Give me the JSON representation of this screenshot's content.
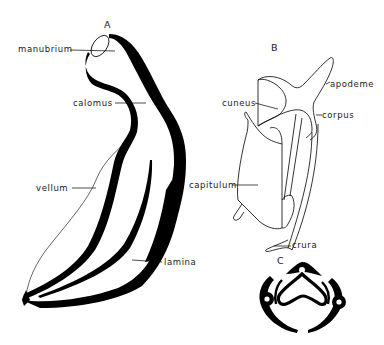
{
  "figure_A": {
    "letter": "A",
    "labels": {
      "manubrium": "manubrium",
      "calomus": "calomus",
      "vellum": "vellum",
      "lamina": "lamina"
    }
  },
  "figure_B": {
    "letter": "B",
    "labels": {
      "apodeme": "apodeme",
      "cuneus": "cuneus",
      "corpus": "corpus",
      "capitulum": "capitulum",
      "crura": "crura"
    }
  },
  "figure_C": {
    "letter": "C"
  },
  "colors": {
    "ink": "#000000",
    "background": "#ffffff"
  }
}
